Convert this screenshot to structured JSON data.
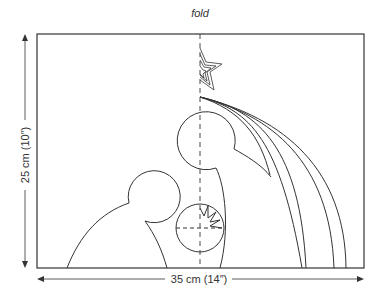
{
  "diagram": {
    "fold_label": "fold",
    "height_label": "25 cm (10″)",
    "width_label": "35 cm (14″)",
    "elements": [
      "star",
      "shooting-star-trails",
      "tall-figure-head",
      "kneeling-figure",
      "manger-sun-circle",
      "fold-line"
    ]
  }
}
